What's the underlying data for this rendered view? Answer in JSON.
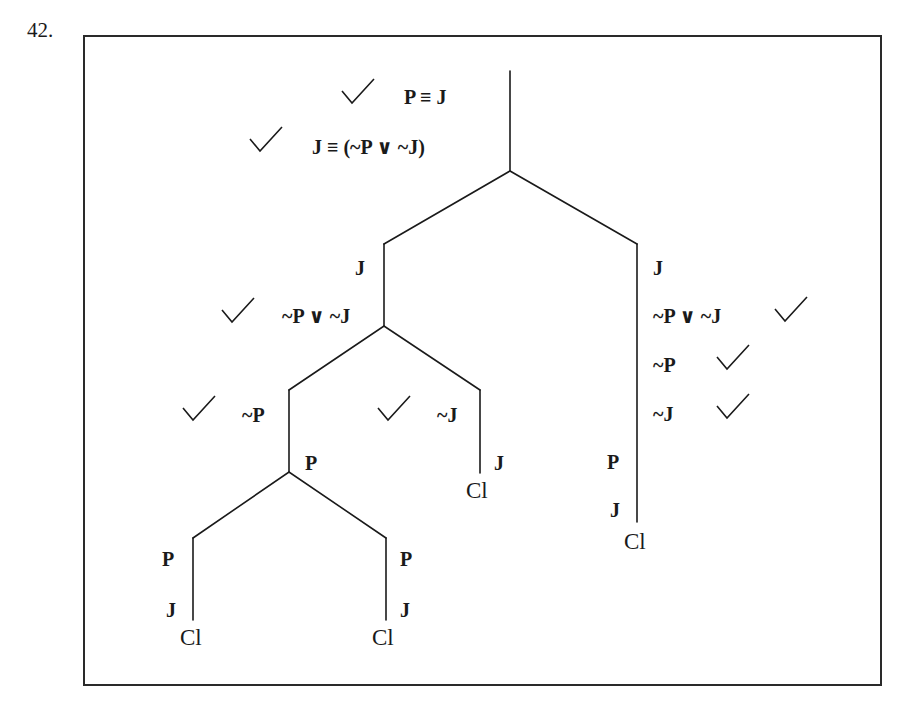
{
  "problem_number": "42.",
  "premises": [
    {
      "text": "P ≡ J",
      "checked": true
    },
    {
      "text": "J ≡ (~P ∨ ~J)",
      "checked": true
    }
  ],
  "left_branch": {
    "lines": [
      {
        "text": "J",
        "checked": false
      },
      {
        "text": "~P ∨ ~J",
        "checked": true
      }
    ],
    "left": {
      "lines": [
        {
          "text": "~P",
          "checked": true
        },
        {
          "text": "P",
          "checked": false
        }
      ],
      "left": {
        "lines": [
          {
            "text": "P"
          },
          {
            "text": "J"
          }
        ],
        "status": "Cl"
      },
      "right": {
        "lines": [
          {
            "text": "P"
          },
          {
            "text": "J"
          }
        ],
        "status": "Cl"
      }
    },
    "right": {
      "lines": [
        {
          "text": "~J",
          "checked": true
        },
        {
          "text": "J",
          "checked": false
        }
      ],
      "status": "Cl"
    }
  },
  "right_branch": {
    "lines": [
      {
        "text": "J",
        "checked": false
      },
      {
        "text": "~P ∨ ~J",
        "checked": true
      },
      {
        "text": "~P",
        "checked": true
      },
      {
        "text": "~J",
        "checked": true
      },
      {
        "text": "P",
        "checked": false
      },
      {
        "text": "J",
        "checked": false
      }
    ],
    "status": "Cl"
  },
  "colors": {
    "ink": "#1a1a1a",
    "background": "#ffffff"
  }
}
